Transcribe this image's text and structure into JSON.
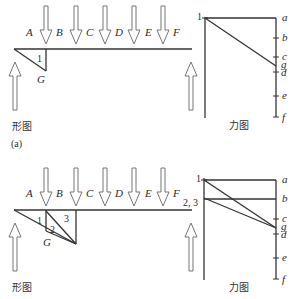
{
  "colors": {
    "line": "#333333",
    "arrow": "#666666",
    "background": "#ffffff"
  },
  "panels": [
    {
      "id": "a",
      "space_labels": [
        "A",
        "B",
        "C",
        "D",
        "E",
        "F"
      ],
      "node_label": "G",
      "member_labels": [
        "1"
      ],
      "form_caption": "形图",
      "force_caption": "力图",
      "panel_caption": "(a)",
      "force_diagram": {
        "node_labels": [
          "1"
        ],
        "scale_labels": [
          "a",
          "b",
          "c",
          "g",
          "d",
          "e",
          "f"
        ]
      }
    },
    {
      "id": "b",
      "space_labels": [
        "A",
        "B",
        "C",
        "D",
        "E",
        "F"
      ],
      "node_label": "G",
      "member_labels": [
        "1",
        "2",
        "3"
      ],
      "right_label": "2, 3",
      "form_caption": "形图",
      "force_caption": "力图",
      "force_diagram": {
        "node_labels": [
          "1",
          "3"
        ],
        "scale_labels": [
          "a",
          "b",
          "c",
          "g",
          "d",
          "e",
          "f"
        ]
      }
    }
  ]
}
